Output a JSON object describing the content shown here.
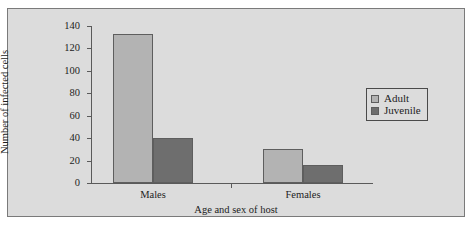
{
  "chart_data": {
    "type": "bar",
    "title": "",
    "xlabel": "Age and sex of host",
    "ylabel": "Number of infected cells",
    "categories": [
      "Males",
      "Females"
    ],
    "series": [
      {
        "name": "Adult",
        "values": [
          133,
          30
        ],
        "color": "#b3b3b3"
      },
      {
        "name": "Juvenile",
        "values": [
          40,
          16
        ],
        "color": "#6e6e6e"
      }
    ],
    "ylim": [
      0,
      140
    ],
    "yticks": [
      0,
      20,
      40,
      60,
      80,
      100,
      120,
      140
    ],
    "ytick_labels": [
      "0",
      "20",
      "40",
      "60",
      "80",
      "100",
      "120",
      "140"
    ],
    "grid": false,
    "legend_position": "right"
  },
  "axes": {
    "y_tick_0": "0",
    "y_tick_1": "20",
    "y_tick_2": "40",
    "y_tick_3": "60",
    "y_tick_4": "80",
    "y_tick_5": "100",
    "y_tick_6": "120",
    "y_tick_7": "140",
    "x_cat_0": "Males",
    "x_cat_1": "Females",
    "x_title": "Age and sex of host",
    "y_title": "Number of infected cells"
  },
  "legend": {
    "items": [
      {
        "label": "Adult"
      },
      {
        "label": "Juvenile"
      }
    ]
  }
}
